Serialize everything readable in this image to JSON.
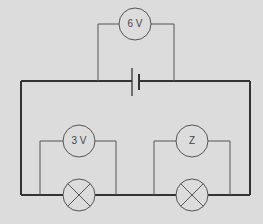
{
  "diagram": {
    "type": "circuit",
    "background": "#dcdcdc",
    "wire_color": "#333333",
    "thin_wire_color": "#555555",
    "components": {
      "battery": {
        "kind": "cell"
      },
      "voltmeter_supply": {
        "label": "6 V"
      },
      "voltmeter_lamp1": {
        "label": "3 V"
      },
      "voltmeter_lamp2": {
        "label": "Z"
      },
      "lamp1": {
        "kind": "lamp"
      },
      "lamp2": {
        "kind": "lamp"
      }
    }
  }
}
